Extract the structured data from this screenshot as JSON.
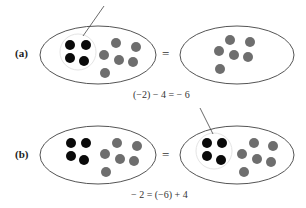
{
  "diagram": {
    "panels": [
      {
        "label": "(a)",
        "equals": "=",
        "equation": "(−2) − 4 = − 6",
        "left_set": {
          "black_dots": 4,
          "gray_dots": 6,
          "black_group_circled": true
        },
        "right_set": {
          "black_dots": 0,
          "gray_dots": 6
        }
      },
      {
        "label": "(b)",
        "equals": "=",
        "equation": "− 2 = (−6) + 4",
        "left_set": {
          "black_dots": 4,
          "gray_dots": 6,
          "black_group_circled": false
        },
        "right_set": {
          "black_dots": 4,
          "gray_dots": 6,
          "black_group_circled": true
        }
      }
    ],
    "colors": {
      "black_dot": "#0a0a0a",
      "gray_dot": "#6e6e6e",
      "outline": "#555555"
    }
  }
}
